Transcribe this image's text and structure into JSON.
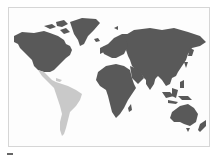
{
  "map": {
    "type": "world-choropleth",
    "colors": {
      "highlight": "#c9c9c9",
      "default": "#595959",
      "background": "#fdfdfd",
      "border": "#d6d6d6"
    },
    "regions": [
      {
        "name": "North America",
        "shade": "default"
      },
      {
        "name": "Greenland",
        "shade": "default"
      },
      {
        "name": "Central and South America",
        "shade": "highlight"
      },
      {
        "name": "Europe",
        "shade": "default"
      },
      {
        "name": "Africa",
        "shade": "default"
      },
      {
        "name": "Asia",
        "shade": "default"
      },
      {
        "name": "Oceania",
        "shade": "default"
      }
    ]
  }
}
